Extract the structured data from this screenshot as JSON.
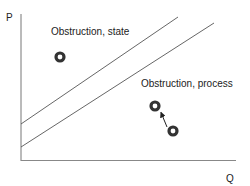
{
  "diagram": {
    "axes": {
      "y_label": "P",
      "x_label": "Q"
    },
    "regions": [
      {
        "label": "Obstruction, state"
      },
      {
        "label": "Obstruction, process"
      }
    ],
    "lines": [
      {
        "name": "upper-boundary",
        "from": [
          21,
          124
        ],
        "to": [
          178,
          17
        ]
      },
      {
        "name": "lower-boundary",
        "from": [
          21,
          147
        ],
        "to": [
          214,
          23
        ]
      }
    ],
    "markers": [
      {
        "name": "state-point",
        "cx": 60,
        "cy": 57
      },
      {
        "name": "process-end-point",
        "cx": 155,
        "cy": 106
      },
      {
        "name": "process-start-point",
        "cx": 173,
        "cy": 131
      }
    ],
    "arrow": {
      "from": [
        167,
        127
      ],
      "to": [
        160,
        111
      ]
    },
    "colors": {
      "line": "#555555",
      "marker": "#333333",
      "axis": "#777777"
    }
  }
}
